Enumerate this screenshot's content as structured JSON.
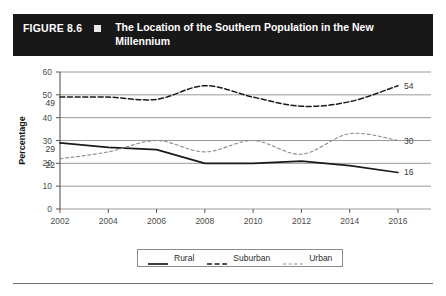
{
  "figure": {
    "number": "FIGURE 8.6",
    "bullet": "square-bullet",
    "title": "The Location of the Southern Population in the New Millennium"
  },
  "legend": {
    "position": "bottom-center",
    "items": [
      {
        "label": "Rural",
        "style": "solid"
      },
      {
        "label": "Suburban",
        "style": "dashed"
      },
      {
        "label": "Urban",
        "style": "fine-dashed"
      }
    ]
  },
  "colors": {
    "header_bg": "#181818",
    "header_text": "#ffffff",
    "gridline": "#9a9a9a",
    "axis": "#555555",
    "series_line": "#1a1a1a",
    "label_text": "#3a3a3a"
  },
  "chart_data": {
    "type": "line",
    "title": "The Location of the Southern Population in the New Millennium",
    "xlabel": "",
    "ylabel": "Percentage",
    "x": [
      2002,
      2004,
      2006,
      2008,
      2010,
      2012,
      2014,
      2016
    ],
    "categories": [
      "2002",
      "2004",
      "2006",
      "2008",
      "2010",
      "2012",
      "2014",
      "2016"
    ],
    "ylim": [
      0,
      60
    ],
    "yticks": [
      0,
      10,
      20,
      30,
      40,
      50,
      60
    ],
    "grid": true,
    "series": [
      {
        "name": "Rural",
        "style": "solid",
        "values": [
          29,
          27,
          26,
          20,
          20,
          21,
          19,
          16
        ],
        "start_label": "29",
        "end_label": "16"
      },
      {
        "name": "Suburban",
        "style": "dashed",
        "values": [
          49,
          49,
          48,
          54,
          49,
          45,
          47,
          54
        ],
        "start_label": "49",
        "end_label": "54"
      },
      {
        "name": "Urban",
        "style": "fine-dashed",
        "values": [
          22,
          25,
          30,
          25,
          30,
          24,
          33,
          30
        ],
        "start_label": "22",
        "end_label": "30"
      }
    ]
  }
}
